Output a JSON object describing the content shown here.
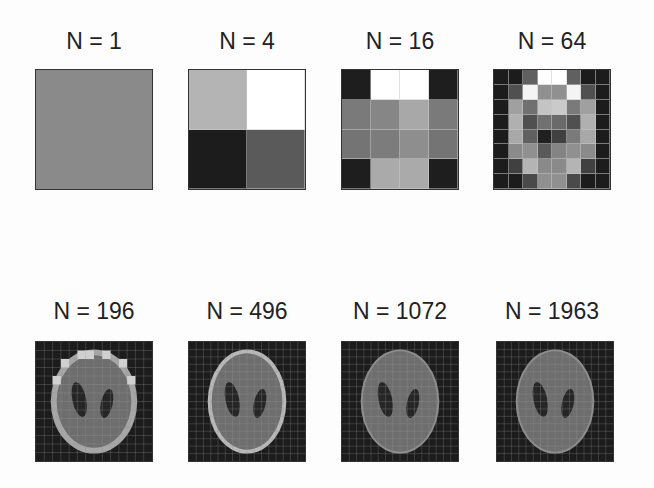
{
  "figure": {
    "panels": [
      {
        "label": "N = 1",
        "n": 1,
        "grid": 1,
        "cells": [
          "#8a8a8a"
        ]
      },
      {
        "label": "N = 4",
        "n": 4,
        "grid": 2,
        "cells": [
          "#b4b4b4",
          "#ffffff",
          "#1c1c1c",
          "#5a5a5a"
        ]
      },
      {
        "label": "N = 16",
        "n": 16,
        "grid": 4,
        "cells": [
          "#1e1e1e",
          "#ffffff",
          "#ffffff",
          "#1e1e1e",
          "#7a7a7a",
          "#868686",
          "#a8a8a8",
          "#7a7a7a",
          "#747474",
          "#7c7c7c",
          "#8e8e8e",
          "#747474",
          "#1e1e1e",
          "#aaaaaa",
          "#aaaaaa",
          "#1e1e1e"
        ]
      },
      {
        "label": "N = 64",
        "n": 64,
        "grid": 8,
        "cells": [
          "#1c1c1c",
          "#1c1c1c",
          "#606060",
          "#ffffff",
          "#ffffff",
          "#606060",
          "#1c1c1c",
          "#1c1c1c",
          "#1c1c1c",
          "#505050",
          "#f4f4f4",
          "#909090",
          "#909090",
          "#f4f4f4",
          "#505050",
          "#1c1c1c",
          "#1c1c1c",
          "#a0a0a0",
          "#707070",
          "#c4c4c4",
          "#cacaca",
          "#7a7a7a",
          "#a0a0a0",
          "#1c1c1c",
          "#1c1c1c",
          "#b0b0b0",
          "#505050",
          "#707070",
          "#6a6a6a",
          "#505050",
          "#b0b0b0",
          "#1c1c1c",
          "#1c1c1c",
          "#a8a8a8",
          "#606060",
          "#202020",
          "#404040",
          "#7a7a7a",
          "#a8a8a8",
          "#1c1c1c",
          "#1c1c1c",
          "#8a8a8a",
          "#909090",
          "#5a5a5a",
          "#848484",
          "#909090",
          "#8a8a8a",
          "#1c1c1c",
          "#1c1c1c",
          "#404040",
          "#b4b4b4",
          "#8a8a8a",
          "#8a8a8a",
          "#b4b4b4",
          "#404040",
          "#1c1c1c",
          "#1c1c1c",
          "#1c1c1c",
          "#4a4a4a",
          "#909090",
          "#909090",
          "#4a4a4a",
          "#1c1c1c",
          "#1c1c1c"
        ]
      },
      {
        "label": "N = 196",
        "n": 196,
        "grid": 14,
        "kind": "phantom",
        "style": "coarse"
      },
      {
        "label": "N = 496",
        "n": 496,
        "grid": 16,
        "kind": "phantom",
        "style": "medium"
      },
      {
        "label": "N = 1072",
        "n": 1072,
        "grid": 16,
        "kind": "phantom",
        "style": "fine"
      },
      {
        "label": "N = 1963",
        "n": 1963,
        "grid": 16,
        "kind": "phantom",
        "style": "finest"
      }
    ],
    "colors": {
      "background": "#1c1c1c",
      "ellipse_fill": "#6e6e6e",
      "ellipse_rim": "#b8b8b8",
      "dark_lobes": "#262626",
      "gridline": "#9a9a9a"
    }
  }
}
